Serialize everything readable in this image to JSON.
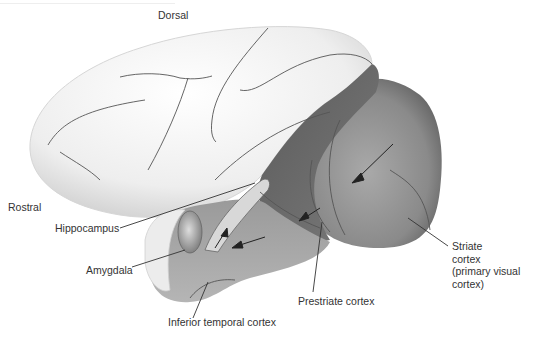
{
  "diagram": {
    "orientation_labels": {
      "dorsal": "Dorsal",
      "rostral": "Rostral"
    },
    "labels": {
      "hippocampus": "Hippocampus",
      "amygdala": "Amygdala",
      "inferior_temporal_cortex": "Inferior temporal cortex",
      "prestriate_cortex": "Prestriate cortex",
      "striate_cortex_line1": "Striate",
      "striate_cortex_line2": "cortex",
      "striate_cortex_line3": "(primary visual",
      "striate_cortex_line4": "cortex)"
    },
    "pathway": [
      "Striate cortex",
      "Prestriate cortex",
      "Inferior temporal cortex",
      "Amygdala / Hippocampus"
    ],
    "colors": {
      "cortex_light": "#f2f2f2",
      "sulcus_line": "#555555",
      "prestriate_dark": "#6e6e6e",
      "striate_mid": "#8c8c8c",
      "temporal_mid": "#a8a8a8",
      "label_text": "#333333",
      "leader_line": "#333333"
    }
  }
}
